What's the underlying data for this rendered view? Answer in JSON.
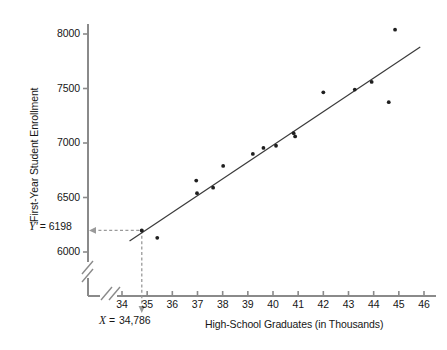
{
  "chart_data": {
    "type": "scatter",
    "title": "",
    "xlabel": "High-School Graduates (in Thousands)",
    "ylabel": "First-Year Student Enrollment",
    "xlim": [
      33.6,
      46.4
    ],
    "ylim": [
      5880,
      8120
    ],
    "xticks": [
      34,
      35,
      36,
      37,
      38,
      39,
      40,
      41,
      42,
      43,
      44,
      45,
      46
    ],
    "yticks": [
      6000,
      6500,
      7000,
      7500,
      8000
    ],
    "xtick_labels": [
      "34",
      "35",
      "36",
      "37",
      "38",
      "39",
      "40",
      "41",
      "42",
      "43",
      "44",
      "45",
      "46"
    ],
    "ytick_labels": [
      "6000",
      "6500",
      "7000",
      "7500",
      "8000"
    ],
    "grid": false,
    "legend": null,
    "axis_break_x": true,
    "axis_break_y": true,
    "points": [
      {
        "x": 35.4,
        "y": 6130
      },
      {
        "x": 36.95,
        "y": 6655
      },
      {
        "x": 36.98,
        "y": 6540
      },
      {
        "x": 37.62,
        "y": 6590
      },
      {
        "x": 38.02,
        "y": 6790
      },
      {
        "x": 39.2,
        "y": 6900
      },
      {
        "x": 39.62,
        "y": 6955
      },
      {
        "x": 40.12,
        "y": 6975
      },
      {
        "x": 40.82,
        "y": 7090
      },
      {
        "x": 40.88,
        "y": 7060
      },
      {
        "x": 42.0,
        "y": 7465
      },
      {
        "x": 43.25,
        "y": 7490
      },
      {
        "x": 43.92,
        "y": 7560
      },
      {
        "x": 44.6,
        "y": 7375
      },
      {
        "x": 44.85,
        "y": 8040
      }
    ],
    "regression_line": {
      "x_start": 34.3,
      "y_start": 6100,
      "x_end": 45.85,
      "y_end": 7880
    },
    "annotations": {
      "predicted_y": {
        "label_prefix": "Y'",
        "label_eq": "=",
        "label_value": "6198",
        "y_value": 6198,
        "leader": "horizontal-dashed-arrow-to-axis"
      },
      "given_x": {
        "label_prefix": "X",
        "label_eq": "=",
        "label_value": "34,786",
        "x_value": 34.786,
        "leader": "vertical-dashed-arrow-to-axis"
      },
      "marked_point": {
        "x": 34.786,
        "y": 6198
      }
    },
    "colors": {
      "point": "#1f1f1f",
      "line": "#3a3a3a",
      "axis": "#8a8a8a",
      "dashed_guide": "#9a9a9a",
      "text": "#161616"
    }
  }
}
